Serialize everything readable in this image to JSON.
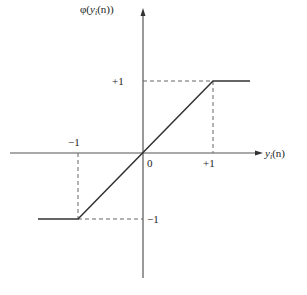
{
  "diagram": {
    "type": "saturating linear activation function graph",
    "colors": {
      "axis": "#555555",
      "curve": "#333333",
      "guide": "#666666",
      "background": "#ffffff"
    },
    "y_axis": {
      "label_prefix": "φ(",
      "label_var": "y",
      "label_sub": "i",
      "label_suffix": "(n))"
    },
    "x_axis": {
      "label_var": "y",
      "label_sub": "i",
      "label_suffix": "(n)"
    },
    "ticks": {
      "origin": "0",
      "x_neg": "−1",
      "x_pos": "+1",
      "y_pos": "+1",
      "y_neg": "−1"
    },
    "function": {
      "description": "φ(v) = −1 for v ≤ −1; v for −1 < v < +1; +1 for v ≥ +1",
      "breakpoints": [
        [
          -1,
          -1
        ],
        [
          1,
          1
        ]
      ]
    }
  }
}
